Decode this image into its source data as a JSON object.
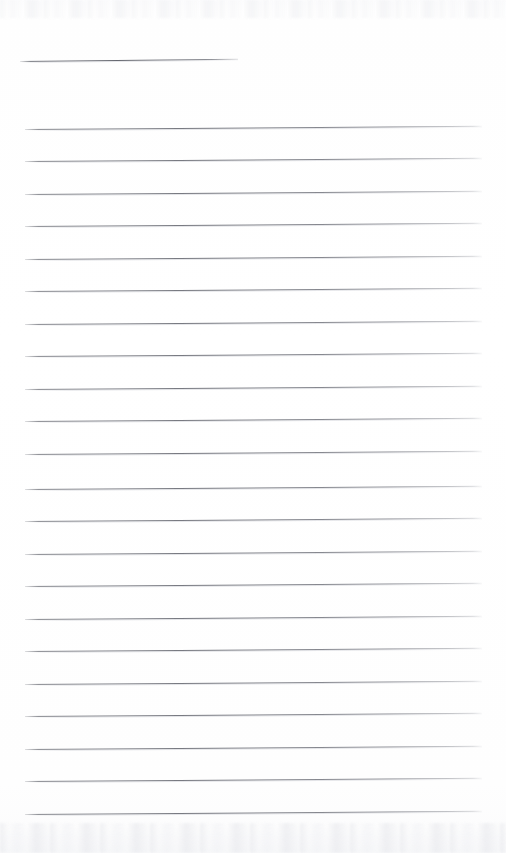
{
  "document": {
    "kind": "scanned-lined-paper",
    "title": "",
    "body_text": "",
    "handwriting": "",
    "page_number": "",
    "visible_text": "none",
    "notes_label": ""
  },
  "canvas": {
    "width": 506,
    "height": 853,
    "background_color": "#fefefe",
    "paper_tint": "#fdfdfe"
  },
  "rules": {
    "ink_color": "#6e7078",
    "halo_color": "#c4c6cd",
    "count_total": 23,
    "skew_degrees": -0.4,
    "spacing_px": 32.4,
    "left_x": 25,
    "right_x": 482,
    "items": [
      {
        "name": "header-rule",
        "y": 61,
        "x": 20,
        "width": 218,
        "variant": "short"
      },
      {
        "name": "body-rule-1",
        "y": 129,
        "x": 25,
        "width": 457,
        "variant": "full"
      },
      {
        "name": "body-rule-2",
        "y": 161,
        "x": 25,
        "width": 457,
        "variant": "full"
      },
      {
        "name": "body-rule-3",
        "y": 194,
        "x": 25,
        "width": 457,
        "variant": "full"
      },
      {
        "name": "body-rule-4",
        "y": 226,
        "x": 25,
        "width": 457,
        "variant": "full"
      },
      {
        "name": "body-rule-5",
        "y": 259,
        "x": 25,
        "width": 457,
        "variant": "full"
      },
      {
        "name": "body-rule-6",
        "y": 291,
        "x": 25,
        "width": 457,
        "variant": "full"
      },
      {
        "name": "body-rule-7",
        "y": 324,
        "x": 25,
        "width": 457,
        "variant": "full"
      },
      {
        "name": "body-rule-8",
        "y": 356,
        "x": 25,
        "width": 457,
        "variant": "full"
      },
      {
        "name": "body-rule-9",
        "y": 389,
        "x": 25,
        "width": 457,
        "variant": "full"
      },
      {
        "name": "body-rule-10",
        "y": 421,
        "x": 25,
        "width": 457,
        "variant": "full"
      },
      {
        "name": "body-rule-11",
        "y": 454,
        "x": 25,
        "width": 457,
        "variant": "full"
      },
      {
        "name": "body-rule-12",
        "y": 489,
        "x": 25,
        "width": 457,
        "variant": "full"
      },
      {
        "name": "body-rule-13",
        "y": 521,
        "x": 25,
        "width": 457,
        "variant": "full"
      },
      {
        "name": "body-rule-14",
        "y": 554,
        "x": 25,
        "width": 457,
        "variant": "full"
      },
      {
        "name": "body-rule-15",
        "y": 586,
        "x": 25,
        "width": 457,
        "variant": "full"
      },
      {
        "name": "body-rule-16",
        "y": 619,
        "x": 25,
        "width": 457,
        "variant": "full"
      },
      {
        "name": "body-rule-17",
        "y": 651,
        "x": 25,
        "width": 457,
        "variant": "full"
      },
      {
        "name": "body-rule-18",
        "y": 684,
        "x": 25,
        "width": 457,
        "variant": "full"
      },
      {
        "name": "body-rule-19",
        "y": 716,
        "x": 25,
        "width": 457,
        "variant": "full"
      },
      {
        "name": "body-rule-20",
        "y": 749,
        "x": 25,
        "width": 457,
        "variant": "full"
      },
      {
        "name": "body-rule-21",
        "y": 781,
        "x": 25,
        "width": 457,
        "variant": "full"
      },
      {
        "name": "body-rule-22",
        "y": 814,
        "x": 25,
        "width": 457,
        "variant": "full"
      }
    ]
  }
}
